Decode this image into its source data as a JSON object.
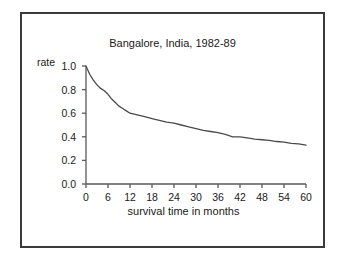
{
  "figure": {
    "background_color": "#ffffff",
    "frame_color": "#3a3a3a",
    "line_color": "#4a4a4a",
    "axis_color": "#5a5a5a",
    "text_color": "#1a1a1a"
  },
  "chart_data": {
    "type": "line",
    "title": "Bangalore, India, 1982-89",
    "xlabel": "survival time in months",
    "ylabel": "rate",
    "xlim": [
      0,
      60
    ],
    "ylim": [
      0.0,
      1.0
    ],
    "grid": false,
    "legend": "none",
    "xticks": [
      0,
      6,
      12,
      18,
      24,
      30,
      36,
      42,
      48,
      54,
      60
    ],
    "xtick_labels": [
      "0",
      "6",
      "12",
      "18",
      "24",
      "30",
      "36",
      "42",
      "48",
      "54",
      "60"
    ],
    "yticks": [
      0.0,
      0.2,
      0.4,
      0.6,
      0.8,
      1.0
    ],
    "ytick_labels": [
      "0.0",
      "0.2",
      "0.4",
      "0.6",
      "0.8",
      "1.0"
    ],
    "series": [
      {
        "name": "survival rate",
        "x": [
          0,
          1,
          2,
          3,
          4,
          5,
          6,
          7,
          8,
          9,
          10,
          11,
          12,
          14,
          16,
          18,
          20,
          22,
          24,
          26,
          28,
          30,
          32,
          34,
          36,
          38,
          39,
          40,
          41,
          42,
          44,
          46,
          48,
          50,
          52,
          54,
          56,
          58,
          60
        ],
        "y": [
          1.0,
          0.93,
          0.88,
          0.84,
          0.81,
          0.79,
          0.76,
          0.72,
          0.69,
          0.66,
          0.64,
          0.62,
          0.6,
          0.585,
          0.57,
          0.555,
          0.54,
          0.525,
          0.515,
          0.5,
          0.485,
          0.47,
          0.455,
          0.445,
          0.435,
          0.42,
          0.41,
          0.4,
          0.4,
          0.4,
          0.39,
          0.38,
          0.375,
          0.37,
          0.36,
          0.355,
          0.345,
          0.34,
          0.33
        ]
      }
    ]
  }
}
